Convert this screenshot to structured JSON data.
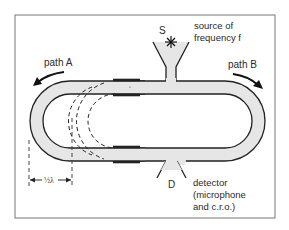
{
  "figure": {
    "type": "diagram",
    "colors": {
      "frame": "#777777",
      "tube_fill": "#e6e6e6",
      "line": "#222222",
      "background": "#ffffff"
    }
  },
  "labels": {
    "path_a": "path A",
    "path_b": "path B",
    "source_letter": "S",
    "source_desc_line1": "source of",
    "source_desc_line2": "frequency f",
    "detector_letter": "D",
    "detector_desc_line1": "detector",
    "detector_desc_line2": "(microphone",
    "detector_desc_line3": "and c.r.o.)",
    "half_wavelength": "½λ"
  },
  "components": [
    {
      "id": "source",
      "label": "S",
      "description": "source of frequency f",
      "icon": "star-burst"
    },
    {
      "id": "detector",
      "label": "D",
      "description": "detector (microphone and c.r.o.)"
    },
    {
      "id": "path-a",
      "label": "path A",
      "direction": "counter-clockwise, sliding left loop"
    },
    {
      "id": "path-b",
      "label": "path B",
      "direction": "clockwise, fixed right loop"
    },
    {
      "id": "slide-displacement",
      "label": "½λ",
      "meaning": "slide displacement of half a wavelength shown by dashed positions"
    }
  ]
}
